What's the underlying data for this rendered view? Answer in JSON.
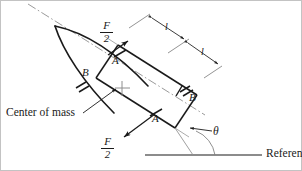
{
  "figure": {
    "type": "free-body-diagram",
    "background_color": "#ffffff",
    "line_color": "#1a1a1a",
    "border_color": "#b9b9b9"
  },
  "labels": {
    "force_top": {
      "numerator": "F",
      "denominator": "2"
    },
    "force_bottom": {
      "numerator": "F",
      "denominator": "2"
    },
    "point_a_top": "A",
    "point_a_bottom": "A",
    "point_b_left": "B",
    "point_b_right": "B",
    "dimension_upper": "l",
    "dimension_lower": "l",
    "center_of_mass": "Center of mass",
    "angle": "θ",
    "reference": "Reference"
  },
  "geometry": {
    "incline_angle_deg": 32,
    "hull_bow_x": 55,
    "hull_bow_y": 26,
    "center_of_mass_x": 122,
    "center_of_mass_y": 88,
    "reference_line_y": 155,
    "segment_length_label": "l",
    "segments": 2
  }
}
